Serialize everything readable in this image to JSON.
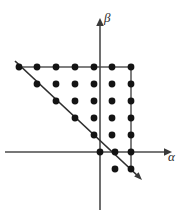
{
  "figure": {
    "background_color": "#ffffff",
    "width": 185,
    "height": 216
  },
  "axes": {
    "horizontal": {
      "name": "alpha-axis",
      "label": "α",
      "y": 152,
      "x_start": 5,
      "x_end": 166,
      "arrow": "right",
      "color": "#4a4a4a"
    },
    "vertical": {
      "name": "beta-axis",
      "label": "β",
      "x": 100,
      "y_start": 210,
      "y_end": 20,
      "arrow": "up",
      "color": "#4a4a4a"
    }
  },
  "boundaries": {
    "top_line": {
      "name": "top-boundary",
      "x1": 17,
      "y1": 67,
      "x2": 133,
      "y2": 67,
      "color": "#555555"
    },
    "right_line": {
      "name": "right-boundary",
      "x1": 131,
      "y1": 65,
      "x2": 131,
      "y2": 172,
      "color": "#555555"
    },
    "diagonal_line": {
      "name": "diagonal-boundary",
      "x1": 15,
      "y1": 61,
      "x2": 142,
      "y2": 180,
      "color": "#2e2e2e"
    }
  },
  "chart_data": {
    "type": "scatter",
    "title": "",
    "xlabel": "α",
    "ylabel": "β",
    "grid": false,
    "legend": "none",
    "origin_px": {
      "x": 100,
      "y": 152
    },
    "spacing_px": {
      "x": 18.7,
      "y": 17.0
    },
    "dot_radius_px": 3.4,
    "dot_color": "#141414",
    "rows": [
      {
        "row": 1,
        "y_px": 67,
        "x_px": [
          19,
          37,
          56,
          75,
          94,
          112,
          131
        ]
      },
      {
        "row": 2,
        "y_px": 84,
        "x_px": [
          37,
          56,
          75,
          94,
          112,
          131
        ]
      },
      {
        "row": 3,
        "y_px": 101,
        "x_px": [
          56,
          75,
          94,
          112,
          131
        ]
      },
      {
        "row": 4,
        "y_px": 118,
        "x_px": [
          75,
          94,
          112,
          131
        ]
      },
      {
        "row": 5,
        "y_px": 135,
        "x_px": [
          94,
          112,
          131
        ]
      },
      {
        "row": 6,
        "y_px": 152,
        "x_px": [
          100,
          115,
          131
        ]
      },
      {
        "row": 7,
        "y_px": 169,
        "x_px": [
          115,
          131
        ]
      }
    ],
    "lattice_points": [
      {
        "x": -4,
        "y": 5
      },
      {
        "x": -3,
        "y": 5
      },
      {
        "x": -2,
        "y": 5
      },
      {
        "x": -1,
        "y": 5
      },
      {
        "x": 0,
        "y": 5
      },
      {
        "x": 1,
        "y": 5
      },
      {
        "x": 2,
        "y": 5
      },
      {
        "x": -3,
        "y": 4
      },
      {
        "x": -2,
        "y": 4
      },
      {
        "x": -1,
        "y": 4
      },
      {
        "x": 0,
        "y": 4
      },
      {
        "x": 1,
        "y": 4
      },
      {
        "x": 2,
        "y": 4
      },
      {
        "x": -2,
        "y": 3
      },
      {
        "x": -1,
        "y": 3
      },
      {
        "x": 0,
        "y": 3
      },
      {
        "x": 1,
        "y": 3
      },
      {
        "x": 2,
        "y": 3
      },
      {
        "x": -1,
        "y": 2
      },
      {
        "x": 0,
        "y": 2
      },
      {
        "x": 1,
        "y": 2
      },
      {
        "x": 2,
        "y": 2
      },
      {
        "x": 0,
        "y": 1
      },
      {
        "x": 1,
        "y": 1
      },
      {
        "x": 2,
        "y": 1
      },
      {
        "x": 0,
        "y": 0
      },
      {
        "x": 1,
        "y": 0
      },
      {
        "x": 2,
        "y": 0
      },
      {
        "x": 1,
        "y": -1
      },
      {
        "x": 2,
        "y": -1
      }
    ],
    "point_count": 31
  },
  "labels": {
    "beta": "β",
    "alpha": "α"
  }
}
